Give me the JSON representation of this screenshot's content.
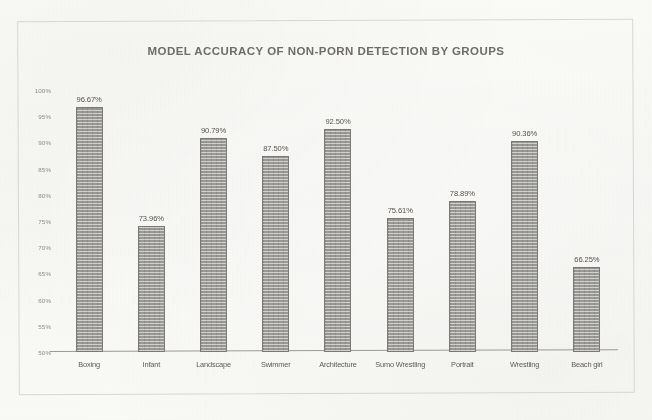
{
  "chart_data": {
    "type": "bar",
    "title": "MODEL ACCURACY OF NON-PORN DETECTION BY GROUPS",
    "xlabel": "",
    "ylabel": "",
    "ylim": [
      50,
      100
    ],
    "grid": false,
    "legend": null,
    "categories": [
      "Boxing",
      "Infant",
      "Landscape",
      "Swimmer",
      "Architecture",
      "Sumo Wrestling",
      "Portrait",
      "Wrestling",
      "Beach girl"
    ],
    "values": [
      96.67,
      73.96,
      90.79,
      87.5,
      92.5,
      75.61,
      78.89,
      90.36,
      66.25
    ],
    "value_labels": [
      "96.67%",
      "73.96%",
      "90.79%",
      "87.50%",
      "92.50%",
      "75.61%",
      "78.89%",
      "90.36%",
      "66.25%"
    ],
    "y_ticks": [
      100,
      95,
      90,
      85,
      80,
      75,
      70,
      65,
      60,
      55,
      50
    ],
    "y_tick_labels": [
      "100%",
      "95%",
      "90%",
      "85%",
      "80%",
      "75%",
      "70%",
      "65%",
      "60%",
      "55%",
      "50%"
    ],
    "bar_color": "#9a9894",
    "bar_edge_color": "#7b7976",
    "title_color": "#6d6c6a",
    "axis_color": "#9b9995",
    "background_color": "#fbfbf8"
  }
}
